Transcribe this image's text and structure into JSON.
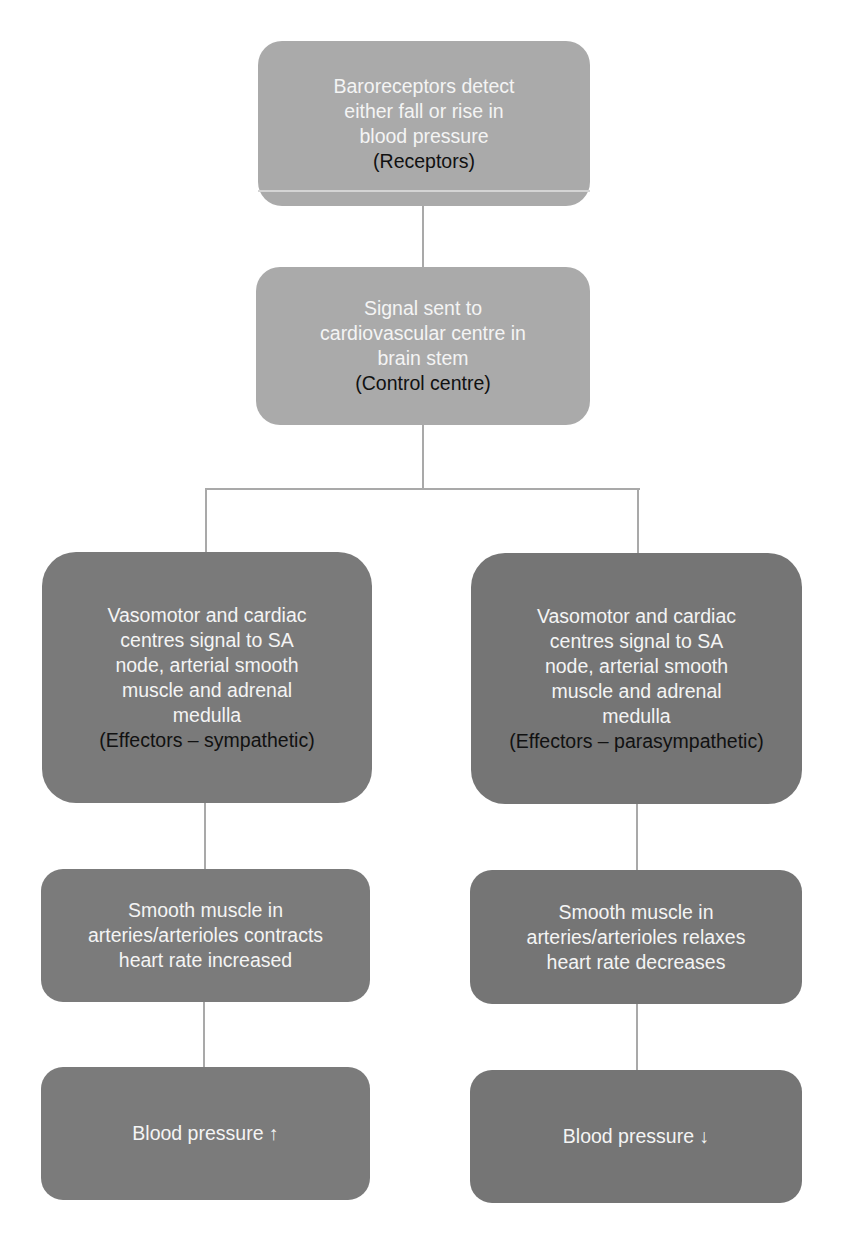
{
  "diagram": {
    "type": "flowchart",
    "colors": {
      "top_boxes": "#aaaaaa",
      "effector_boxes": "#7a7a7a",
      "result_boxes": "#7b7b7b",
      "connector": "#a9a9a9",
      "body_text": "#f4f4f4",
      "role_text": "#111111"
    },
    "nodes": {
      "receptors": {
        "lines": [
          "Baroreceptors detect",
          "either fall or rise in",
          "blood pressure"
        ],
        "role": "(Receptors)"
      },
      "control_centre": {
        "lines": [
          "Signal sent to",
          "cardiovascular centre in",
          "brain stem"
        ],
        "role": "(Control centre)"
      },
      "effectors_sympathetic": {
        "lines": [
          "Vasomotor and cardiac",
          "centres signal to SA",
          "node, arterial smooth",
          "muscle and adrenal",
          "medulla"
        ],
        "role": "(Effectors – sympathetic)"
      },
      "effectors_parasympathetic": {
        "lines": [
          "Vasomotor and cardiac",
          "centres signal to SA",
          "node, arterial smooth",
          "muscle and adrenal",
          "medulla"
        ],
        "role": "(Effectors – parasympathetic)"
      },
      "response_sympathetic": {
        "lines": [
          "Smooth muscle in",
          "arteries/arterioles contracts",
          "heart rate increased"
        ]
      },
      "response_parasympathetic": {
        "lines": [
          "Smooth muscle in",
          "arteries/arterioles relaxes",
          "heart rate decreases"
        ]
      },
      "outcome_sympathetic": {
        "label": "Blood pressure ↑"
      },
      "outcome_parasympathetic": {
        "label": "Blood pressure ↓"
      }
    },
    "edges": [
      [
        "receptors",
        "control_centre"
      ],
      [
        "control_centre",
        "effectors_sympathetic"
      ],
      [
        "control_centre",
        "effectors_parasympathetic"
      ],
      [
        "effectors_sympathetic",
        "response_sympathetic"
      ],
      [
        "effectors_parasympathetic",
        "response_parasympathetic"
      ],
      [
        "response_sympathetic",
        "outcome_sympathetic"
      ],
      [
        "response_parasympathetic",
        "outcome_parasympathetic"
      ]
    ]
  }
}
